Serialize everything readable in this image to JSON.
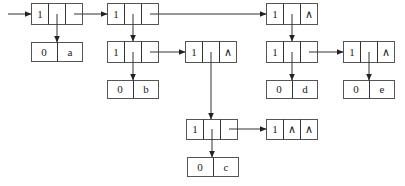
{
  "diagram": {
    "list_nodes": [
      {
        "id": "n1",
        "tag": "1",
        "hp": "ptr",
        "tp": "ptr",
        "x": 31,
        "y": 3
      },
      {
        "id": "n2",
        "tag": "1",
        "hp": "ptr",
        "tp": "ptr",
        "x": 107,
        "y": 3
      },
      {
        "id": "n3",
        "tag": "1",
        "hp": "ptr",
        "tp": "ptr",
        "x": 107,
        "y": 41
      },
      {
        "id": "n4",
        "tag": "1",
        "hp": "ptr",
        "tp": "∧",
        "x": 185,
        "y": 41
      },
      {
        "id": "n5",
        "tag": "1",
        "hp": "ptr",
        "tp": "∧",
        "x": 266,
        "y": 3
      },
      {
        "id": "n6",
        "tag": "1",
        "hp": "ptr",
        "tp": "ptr",
        "x": 266,
        "y": 41
      },
      {
        "id": "n7",
        "tag": "1",
        "hp": "ptr",
        "tp": "∧",
        "x": 343,
        "y": 41
      },
      {
        "id": "n8",
        "tag": "1",
        "hp": "ptr",
        "tp": "ptr",
        "x": 186,
        "y": 119
      },
      {
        "id": "n9",
        "tag": "1",
        "hp": "∧",
        "tp": "∧",
        "x": 266,
        "y": 119
      }
    ],
    "atom_nodes": [
      {
        "id": "a",
        "tag": "0",
        "value": "a",
        "x": 31,
        "y": 42
      },
      {
        "id": "b",
        "tag": "0",
        "value": "b",
        "x": 107,
        "y": 80
      },
      {
        "id": "d",
        "tag": "0",
        "value": "d",
        "x": 266,
        "y": 80
      },
      {
        "id": "e",
        "tag": "0",
        "value": "e",
        "x": 343,
        "y": 80
      },
      {
        "id": "c",
        "tag": "0",
        "value": "c",
        "x": 187,
        "y": 157
      }
    ],
    "edges": [
      {
        "from": "entry",
        "to": "n1",
        "type": "entry"
      },
      {
        "from": "n1",
        "to": "a",
        "type": "head"
      },
      {
        "from": "n1",
        "to": "n2",
        "type": "tail"
      },
      {
        "from": "n2",
        "to": "n3",
        "type": "head"
      },
      {
        "from": "n2",
        "to": "n5",
        "type": "tail"
      },
      {
        "from": "n3",
        "to": "b",
        "type": "head"
      },
      {
        "from": "n3",
        "to": "n4",
        "type": "tail"
      },
      {
        "from": "n4",
        "to": "n8",
        "type": "head"
      },
      {
        "from": "n5",
        "to": "n6",
        "type": "head"
      },
      {
        "from": "n6",
        "to": "d",
        "type": "head"
      },
      {
        "from": "n6",
        "to": "n7",
        "type": "tail"
      },
      {
        "from": "n7",
        "to": "e",
        "type": "head"
      },
      {
        "from": "n8",
        "to": "c",
        "type": "head"
      },
      {
        "from": "n8",
        "to": "n9",
        "type": "tail"
      }
    ]
  },
  "labels": {
    "n1_tag": "1",
    "n2_tag": "1",
    "n3_tag": "1",
    "n4_tag": "1",
    "n4_tp": "∧",
    "n5_tag": "1",
    "n5_tp": "∧",
    "n6_tag": "1",
    "n7_tag": "1",
    "n7_tp": "∧",
    "n8_tag": "1",
    "n9_tag": "1",
    "n9_hp": "∧",
    "n9_tp": "∧",
    "a_tag": "0",
    "a_val": "a",
    "b_tag": "0",
    "b_val": "b",
    "d_tag": "0",
    "d_val": "d",
    "e_tag": "0",
    "e_val": "e",
    "c_tag": "0",
    "c_val": "c"
  }
}
